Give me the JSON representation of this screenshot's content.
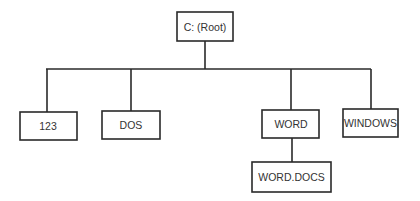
{
  "diagram": {
    "type": "directory-tree",
    "root": {
      "id": "root",
      "label": "C: (Root)",
      "children": [
        {
          "id": "n123",
          "label": "123",
          "children": []
        },
        {
          "id": "dos",
          "label": "DOS",
          "children": []
        },
        {
          "id": "word",
          "label": "WORD",
          "children": [
            {
              "id": "worddocs",
              "label": "WORD.DOCS",
              "children": []
            }
          ]
        },
        {
          "id": "windows",
          "label": "WINDOWS",
          "children": []
        }
      ]
    },
    "colors": {
      "line": "#2a2a2a",
      "text": "#333333",
      "background": "#ffffff"
    }
  }
}
